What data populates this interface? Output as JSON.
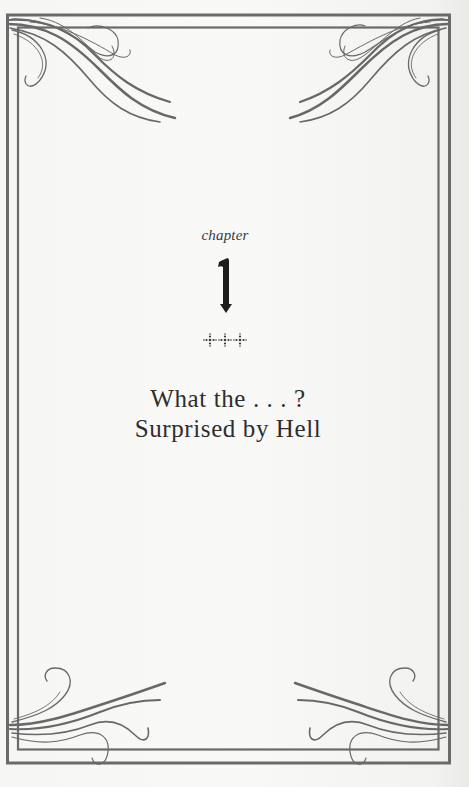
{
  "chapter": {
    "label": "chapter",
    "number": "1",
    "ornament": "three-cross-dots-ornament",
    "title_line1": "What the . . . ?",
    "title_line2": "Surprised by Hell"
  },
  "colors": {
    "paper": "#f6f6f4",
    "frame": "#6b6b6b",
    "text": "#2e2e2e"
  }
}
